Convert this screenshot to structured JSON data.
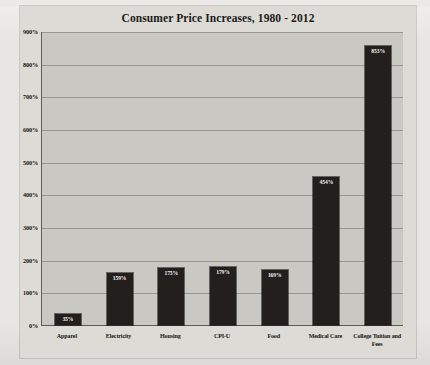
{
  "chart_data": {
    "type": "bar",
    "title": "Consumer Price Increases, 1980 - 2012",
    "xlabel": "",
    "ylabel": "",
    "ylim": [
      0,
      900
    ],
    "grid": true,
    "legend": "none",
    "y_unit": "%",
    "categories": [
      "Apparel",
      "Electricity",
      "Housing",
      "CPI-U",
      "Food",
      "Medical Care",
      "College Tuition and Fees"
    ],
    "values": [
      35,
      159,
      175,
      179,
      169,
      454,
      853
    ],
    "value_labels": [
      "35%",
      "159%",
      "175%",
      "179%",
      "169%",
      "454%",
      "853%"
    ],
    "ytick_labels": [
      "900%",
      "800%",
      "700%",
      "600%",
      "500%",
      "400%",
      "300%",
      "200%",
      "100%",
      "0%"
    ],
    "ytick_values": [
      900,
      800,
      700,
      600,
      500,
      400,
      300,
      200,
      100,
      0
    ],
    "colors": {
      "bar": "#231f1d",
      "bar_label_text": "#f2f0ec",
      "plot_background": "#c9c8c3",
      "card_background": "#dcdbd6",
      "page_background": "#e7e6e2",
      "axis": "#5d5b57",
      "text": "#17150f"
    }
  }
}
